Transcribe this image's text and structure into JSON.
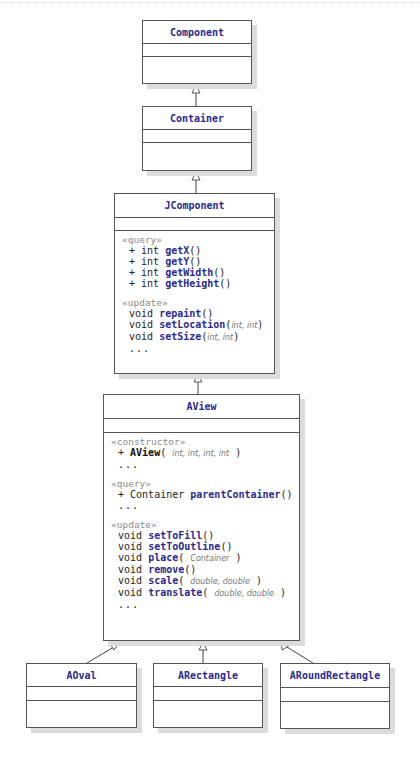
{
  "diagram": {
    "type": "UML class diagram",
    "relationship": "generalization (inheritance)",
    "colors": {
      "class_name": "#2b2a8e",
      "stereotype": "#8a8a8a",
      "border": "#555555",
      "shadow": "#dcdcdc"
    }
  },
  "classes": {
    "component": {
      "name": "Component"
    },
    "container": {
      "name": "Container"
    },
    "jcomponent": {
      "name": "JComponent",
      "sections": {
        "query": {
          "stereotype": "«query»",
          "ops": [
            {
              "vis": "+",
              "type": "int",
              "name": "getX",
              "args": ""
            },
            {
              "vis": "+",
              "type": "int",
              "name": "getY",
              "args": ""
            },
            {
              "vis": "+",
              "type": "int",
              "name": "getWidth",
              "args": ""
            },
            {
              "vis": "+",
              "type": "int",
              "name": "getHeight",
              "args": ""
            }
          ]
        },
        "update": {
          "stereotype": "«update»",
          "ops": [
            {
              "type": "void",
              "name": "repaint",
              "args": ""
            },
            {
              "type": "void",
              "name": "setLocation",
              "args": "int, int"
            },
            {
              "type": "void",
              "name": "setSize",
              "args": "int, int"
            }
          ],
          "ellipsis": "..."
        }
      }
    },
    "aview": {
      "name": "AView",
      "sections": {
        "constructor": {
          "stereotype": "«constructor»",
          "ops": [
            {
              "vis": "+",
              "name": "AView",
              "args": "int, int, int, int"
            }
          ],
          "ellipsis": "..."
        },
        "query": {
          "stereotype": "«query»",
          "ops": [
            {
              "vis": "+",
              "type": "Container",
              "name": "parentContainer",
              "args": ""
            }
          ],
          "ellipsis": "..."
        },
        "update": {
          "stereotype": "«update»",
          "ops": [
            {
              "type": "void",
              "name": "setToFill",
              "args": ""
            },
            {
              "type": "void",
              "name": "setToOutline",
              "args": ""
            },
            {
              "type": "void",
              "name": "place",
              "args": "Container"
            },
            {
              "type": "void",
              "name": "remove",
              "args": ""
            },
            {
              "type": "void",
              "name": "scale",
              "args": "double, double"
            },
            {
              "type": "void",
              "name": "translate",
              "args": "double, double"
            }
          ],
          "ellipsis": "..."
        }
      }
    },
    "aoval": {
      "name": "AOval"
    },
    "arectangle": {
      "name": "ARectangle"
    },
    "aroundrectangle": {
      "name": "ARoundRectangle"
    }
  },
  "edges": [
    {
      "from": "Container",
      "to": "Component"
    },
    {
      "from": "JComponent",
      "to": "Container"
    },
    {
      "from": "AView",
      "to": "JComponent"
    },
    {
      "from": "AOval",
      "to": "AView"
    },
    {
      "from": "ARectangle",
      "to": "AView"
    },
    {
      "from": "ARoundRectangle",
      "to": "AView"
    }
  ],
  "punct": {
    "open": "(",
    "close": ")",
    "empty": "()"
  }
}
